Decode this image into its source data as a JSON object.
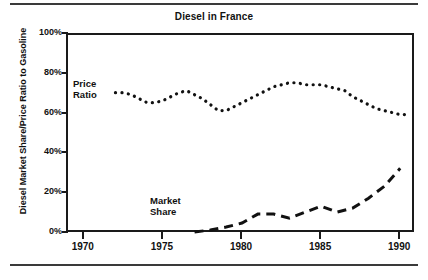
{
  "figure": {
    "title": "Diesel in France",
    "y_axis_label": "Diesel Market Share/Price Ratio to Gasoline"
  },
  "annotations": {
    "price_ratio_line1": "Price",
    "price_ratio_line2": "Ratio",
    "market_share_line1": "Market",
    "market_share_line2": "Share"
  },
  "axes": {
    "y_tick_labels": [
      "100%",
      "80%",
      "60%",
      "40%",
      "20%",
      "0%"
    ],
    "x_tick_labels": [
      "1970",
      "1975",
      "1980",
      "1985",
      "1990"
    ]
  },
  "chart_data": {
    "type": "line",
    "title": "Diesel in France",
    "xlabel": "",
    "ylabel": "Diesel Market Share/Price Ratio to Gasoline",
    "xlim": [
      1969,
      1991
    ],
    "ylim": [
      0,
      100
    ],
    "xticks": [
      1970,
      1975,
      1980,
      1985,
      1990
    ],
    "yticks": [
      0,
      20,
      40,
      60,
      80,
      100
    ],
    "ytick_labels": [
      "0%",
      "20%",
      "40%",
      "60%",
      "80%",
      "100%"
    ],
    "grid": false,
    "legend": "inline-annotations",
    "series": [
      {
        "name": "Price Ratio",
        "style": "dotted",
        "color": "#111111",
        "x": [
          1972,
          1972.5,
          1973,
          1973.5,
          1974,
          1974.5,
          1975,
          1975.5,
          1976,
          1976.5,
          1977,
          1977.5,
          1978,
          1978.5,
          1979,
          1979.5,
          1980,
          1980.5,
          1981,
          1981.5,
          1982,
          1982.5,
          1983,
          1983.5,
          1984,
          1984.5,
          1985,
          1985.5,
          1986,
          1986.5,
          1987,
          1987.5,
          1988,
          1988.5,
          1989,
          1989.5,
          1990,
          1990.5
        ],
        "values": [
          71,
          71,
          70,
          68,
          66,
          66,
          67,
          69,
          71,
          72,
          70,
          68,
          65,
          62,
          62,
          64,
          66,
          68,
          70,
          72,
          74,
          75,
          76,
          76,
          75,
          75,
          75,
          74,
          73,
          72,
          69,
          67,
          65,
          63,
          62,
          61,
          60,
          60
        ]
      },
      {
        "name": "Market Share",
        "style": "dashed",
        "color": "#111111",
        "x": [
          1977,
          1978,
          1979,
          1980,
          1981,
          1982,
          1983,
          1984,
          1985,
          1986,
          1987,
          1988,
          1989,
          1990
        ],
        "values": [
          1,
          2,
          3.5,
          5.5,
          10,
          10,
          8,
          11,
          14,
          11,
          13,
          18,
          24,
          33
        ]
      }
    ]
  },
  "colors": {
    "ink": "#111111",
    "frame": "#1a1a1a",
    "rule": "#3a3a3a",
    "background": "#ffffff"
  }
}
